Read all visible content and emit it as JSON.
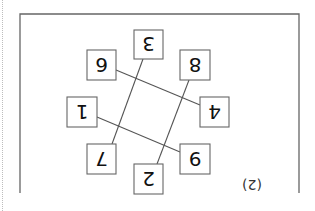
{
  "figure": {
    "label": "(2)",
    "orientation": "rotated 180°",
    "boxes": [
      {
        "id": "top",
        "value": "3"
      },
      {
        "id": "upper-left",
        "value": "6"
      },
      {
        "id": "upper-right",
        "value": "8"
      },
      {
        "id": "left",
        "value": "1"
      },
      {
        "id": "right",
        "value": "4"
      },
      {
        "id": "lower-left",
        "value": "7"
      },
      {
        "id": "lower-right",
        "value": "9"
      },
      {
        "id": "bottom",
        "value": "2"
      }
    ],
    "connections": [
      [
        "top",
        "lower-left"
      ],
      [
        "upper-right",
        "bottom"
      ],
      [
        "upper-left",
        "right"
      ],
      [
        "left",
        "lower-right"
      ]
    ],
    "colors": {
      "stroke": "#555555",
      "frame": "#666666",
      "text": "#111111"
    }
  }
}
